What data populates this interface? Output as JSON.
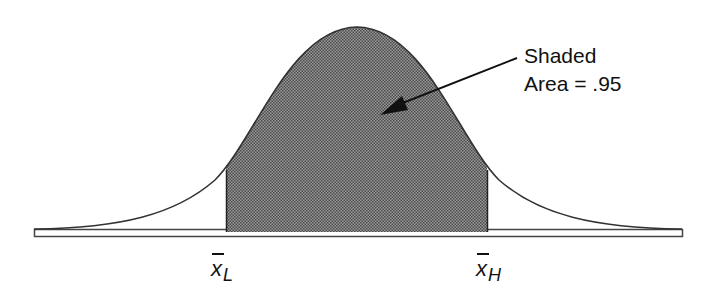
{
  "diagram": {
    "type": "normal-distribution-confidence-interval",
    "annotation": {
      "line1": "Shaded",
      "line2": "Area = .95"
    },
    "lower_bound": {
      "symbol": "x",
      "subscript": "L"
    },
    "upper_bound": {
      "symbol": "x",
      "subscript": "H"
    },
    "shaded_area": 0.95,
    "colors": {
      "curve": "#333333",
      "shade": "#7a7a7a",
      "text": "#111111"
    }
  }
}
